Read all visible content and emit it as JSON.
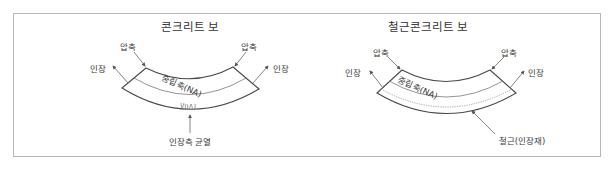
{
  "diagrams": [
    {
      "id": "plain-concrete",
      "title": "콘크리트 보",
      "labels": {
        "compression_left": "압축",
        "compression_right": "압축",
        "tension_left": "인장",
        "tension_right": "인장",
        "neutral_axis": "중립축(NA)",
        "bottom_callout": "인장측 균열"
      }
    },
    {
      "id": "reinforced-concrete",
      "title": "철근콘크리트 보",
      "labels": {
        "compression_left": "압축",
        "compression_right": "압축",
        "tension_left": "인장",
        "tension_right": "인장",
        "neutral_axis": "중립축(NA)",
        "bottom_callout": "철근(인장재)"
      }
    }
  ],
  "colors": {
    "stroke": "#4a4a4a",
    "text": "#3a3a3a",
    "frame": "#b8b8b8"
  }
}
